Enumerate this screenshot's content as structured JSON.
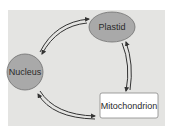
{
  "diagram": {
    "type": "cycle",
    "colors": {
      "background": "#e4e4e2",
      "node_fill": "#a9a9a9",
      "node_stroke": "#707070",
      "box_fill": "#ffffff",
      "arrow": "#333333"
    },
    "nodes": [
      {
        "id": "plastid",
        "label": "Plastid",
        "shape": "ellipse"
      },
      {
        "id": "nucleus",
        "label": "Nucleus",
        "shape": "circle"
      },
      {
        "id": "mitochondrion",
        "label": "Mitochondrion",
        "shape": "rounded-rectangle"
      }
    ],
    "edges": [
      {
        "from": "nucleus",
        "to": "plastid",
        "bidirectional": true
      },
      {
        "from": "plastid",
        "to": "mitochondrion",
        "bidirectional": true
      },
      {
        "from": "mitochondrion",
        "to": "nucleus",
        "bidirectional": true
      }
    ]
  }
}
